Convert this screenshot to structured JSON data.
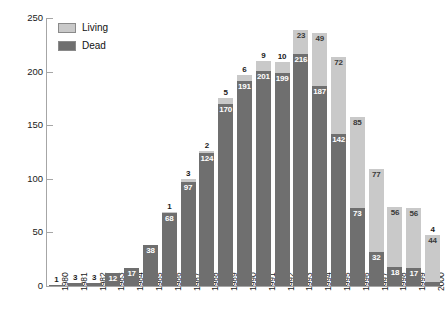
{
  "chart_data": {
    "type": "bar",
    "subtype": "stacked-vertical",
    "title": "",
    "xlabel": "",
    "ylabel": "",
    "ylim": [
      0,
      250
    ],
    "yticks": [
      0,
      50,
      100,
      150,
      200,
      250
    ],
    "grid": false,
    "legend_position": "top-left",
    "categories": [
      "1980",
      "1981",
      "1982",
      "1983",
      "1984",
      "1985",
      "1986",
      "1987",
      "1988",
      "1989",
      "1990",
      "1991",
      "1992",
      "1993",
      "1994",
      "1995",
      "1996",
      "1997",
      "1998",
      "1999",
      "2000"
    ],
    "series": [
      {
        "name": "Dead",
        "color": "#6f6f6f",
        "values": [
          1,
          3,
          3,
          12,
          17,
          38,
          68,
          97,
          124,
          170,
          191,
          201,
          199,
          216,
          187,
          142,
          73,
          32,
          18,
          17,
          4
        ]
      },
      {
        "name": "Living",
        "color": "#c9c9c9",
        "values": [
          0,
          0,
          0,
          0,
          0,
          0,
          1,
          3,
          2,
          5,
          6,
          9,
          10,
          23,
          49,
          72,
          85,
          77,
          56,
          56,
          44
        ]
      }
    ],
    "data_labels": {
      "dead": [
        "1",
        "3",
        "3",
        "12",
        "17",
        "38",
        "68",
        "97",
        "124",
        "170",
        "191",
        "201",
        "199",
        "216",
        "187",
        "142",
        "73",
        "32",
        "18",
        "17",
        "4"
      ],
      "living": [
        "",
        "",
        "",
        "",
        "",
        "",
        "1",
        "3",
        "2",
        "5",
        "6",
        "9",
        "10",
        "23",
        "49",
        "72",
        "85",
        "77",
        "56",
        "56",
        "44"
      ]
    }
  },
  "legend": {
    "items": [
      {
        "label": "Living",
        "color": "#c9c9c9"
      },
      {
        "label": "Dead",
        "color": "#6f6f6f"
      }
    ]
  },
  "axes": {
    "y": {
      "ticks": [
        "250",
        "200",
        "150",
        "100",
        "50",
        "0"
      ]
    },
    "x": {
      "ticks": [
        "1980",
        "1981",
        "1982",
        "1983",
        "1984",
        "1985",
        "1986",
        "1987",
        "1988",
        "1989",
        "1990",
        "1991",
        "1992",
        "1993",
        "1994",
        "1995",
        "1996",
        "1997",
        "1998",
        "1999",
        "2000"
      ]
    }
  }
}
